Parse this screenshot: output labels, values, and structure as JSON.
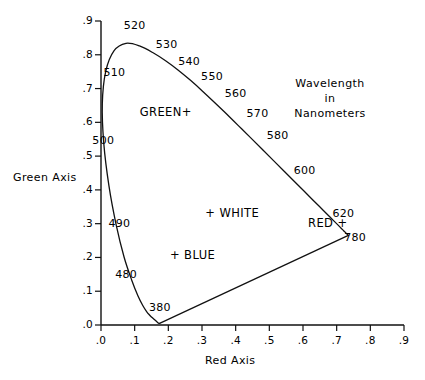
{
  "chart_data": {
    "type": "line",
    "title": "",
    "xlabel": "Red Axis",
    "ylabel": "Green Axis",
    "xlim": [
      0.0,
      0.9
    ],
    "ylim": [
      0.0,
      0.9
    ],
    "xticks": [
      ".0",
      ".1",
      ".2",
      ".3",
      ".4",
      ".5",
      ".6",
      ".7",
      ".8",
      ".9"
    ],
    "yticks": [
      ".0",
      ".1",
      ".2",
      ".3",
      ".4",
      ".5",
      ".6",
      ".7",
      ".8",
      ".9"
    ],
    "grid": false,
    "legend": "none",
    "annotation_note": "Wavelength in Nanometers",
    "series": [
      {
        "name": "spectral-locus",
        "points": [
          [
            0.1741,
            0.005
          ],
          [
            0.174,
            0.005
          ],
          [
            0.1738,
            0.0049
          ],
          [
            0.1736,
            0.0049
          ],
          [
            0.1733,
            0.0048
          ],
          [
            0.173,
            0.0048
          ],
          [
            0.1726,
            0.0048
          ],
          [
            0.1721,
            0.0048
          ],
          [
            0.1714,
            0.0051
          ],
          [
            0.1703,
            0.0058
          ],
          [
            0.1689,
            0.0069
          ],
          [
            0.1669,
            0.0086
          ],
          [
            0.1644,
            0.0109
          ],
          [
            0.1611,
            0.0138
          ],
          [
            0.1566,
            0.0177
          ],
          [
            0.151,
            0.0227
          ],
          [
            0.144,
            0.0297
          ],
          [
            0.1355,
            0.0399
          ],
          [
            0.1241,
            0.0578
          ],
          [
            0.1096,
            0.0868
          ],
          [
            0.0913,
            0.1327
          ],
          [
            0.0687,
            0.2007
          ],
          [
            0.0454,
            0.295
          ],
          [
            0.0235,
            0.4127
          ],
          [
            0.0082,
            0.5384
          ],
          [
            0.0039,
            0.6548
          ],
          [
            0.0139,
            0.7502
          ],
          [
            0.0389,
            0.812
          ],
          [
            0.0743,
            0.8338
          ],
          [
            0.1142,
            0.8262
          ],
          [
            0.1547,
            0.8059
          ],
          [
            0.1929,
            0.7816
          ],
          [
            0.2296,
            0.7543
          ],
          [
            0.2658,
            0.7243
          ],
          [
            0.3016,
            0.6923
          ],
          [
            0.3373,
            0.6589
          ],
          [
            0.3731,
            0.6245
          ],
          [
            0.4087,
            0.5896
          ],
          [
            0.4441,
            0.5547
          ],
          [
            0.4788,
            0.5202
          ],
          [
            0.5125,
            0.4866
          ],
          [
            0.5448,
            0.4544
          ],
          [
            0.5752,
            0.4242
          ],
          [
            0.6029,
            0.3965
          ],
          [
            0.627,
            0.3725
          ],
          [
            0.6482,
            0.3514
          ],
          [
            0.6658,
            0.334
          ],
          [
            0.6801,
            0.3197
          ],
          [
            0.6915,
            0.3083
          ],
          [
            0.7006,
            0.2993
          ],
          [
            0.7079,
            0.292
          ],
          [
            0.714,
            0.2859
          ],
          [
            0.719,
            0.2809
          ],
          [
            0.723,
            0.277
          ],
          [
            0.726,
            0.274
          ],
          [
            0.7283,
            0.2717
          ],
          [
            0.73,
            0.27
          ],
          [
            0.7311,
            0.2689
          ],
          [
            0.732,
            0.268
          ],
          [
            0.7327,
            0.2673
          ],
          [
            0.7334,
            0.2666
          ],
          [
            0.734,
            0.266
          ],
          [
            0.7344,
            0.2656
          ],
          [
            0.7346,
            0.2654
          ],
          [
            0.7347,
            0.2653
          ]
        ]
      },
      {
        "name": "purple-line",
        "points": [
          [
            0.7347,
            0.2653
          ],
          [
            0.1741,
            0.005
          ]
        ]
      }
    ],
    "wavelength_markers": [
      {
        "label": "380",
        "lx": 0.175,
        "ly": 0.05
      },
      {
        "label": "480",
        "lx": 0.075,
        "ly": 0.148
      },
      {
        "label": "490",
        "lx": 0.055,
        "ly": 0.3
      },
      {
        "label": "500",
        "lx": 0.007,
        "ly": 0.545
      },
      {
        "label": "510",
        "lx": 0.04,
        "ly": 0.745
      },
      {
        "label": "520",
        "lx": 0.1,
        "ly": 0.885
      },
      {
        "label": "530",
        "lx": 0.195,
        "ly": 0.83
      },
      {
        "label": "540",
        "lx": 0.262,
        "ly": 0.78
      },
      {
        "label": "550",
        "lx": 0.33,
        "ly": 0.735
      },
      {
        "label": "560",
        "lx": 0.4,
        "ly": 0.685
      },
      {
        "label": "570",
        "lx": 0.465,
        "ly": 0.625
      },
      {
        "label": "580",
        "lx": 0.525,
        "ly": 0.56
      },
      {
        "label": "600",
        "lx": 0.605,
        "ly": 0.455
      },
      {
        "label": "620",
        "lx": 0.72,
        "ly": 0.33
      },
      {
        "label": "780",
        "lx": 0.755,
        "ly": 0.258
      }
    ],
    "region_markers": [
      {
        "label": "GREEN+",
        "lx": 0.115,
        "ly": 0.625
      },
      {
        "label": "+ WHITE",
        "lx": 0.31,
        "ly": 0.325
      },
      {
        "label": "+ BLUE",
        "lx": 0.205,
        "ly": 0.2
      },
      {
        "label": "RED +",
        "lx": 0.615,
        "ly": 0.297
      }
    ]
  },
  "axes": {
    "x_title": "Red Axis",
    "y_title": "Green Axis",
    "x_tick_labels": [
      ".0",
      ".1",
      ".2",
      ".3",
      ".4",
      ".5",
      ".6",
      ".7",
      ".8",
      ".9"
    ],
    "y_tick_labels": [
      ".0",
      ".1",
      ".2",
      ".3",
      ".4",
      ".5",
      ".6",
      ".7",
      ".8",
      ".9"
    ]
  },
  "annotation": {
    "line1": "Wavelength",
    "line2": "in",
    "line3": "Nanometers"
  },
  "colors": {
    "ink": "#111111",
    "background": "#ffffff"
  }
}
